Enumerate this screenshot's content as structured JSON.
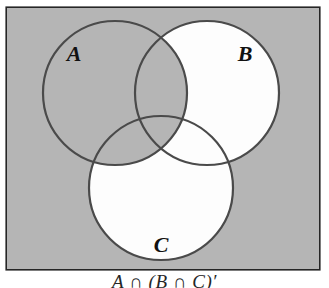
{
  "figure": {
    "kind": "venn-diagram",
    "set_count": 3,
    "panel": {
      "background_color": "#b3b3b3",
      "border_color": "#262626",
      "x": 6,
      "y": 7,
      "width": 314,
      "height": 263
    },
    "shading": {
      "shaded_fill": "#ffffff",
      "unshaded_fill": "#b3b3b3",
      "shaded_description": "regions of B and C that lie outside A",
      "region_states": [
        {
          "region": "A only",
          "fill": "#b3b3b3",
          "shaded": false
        },
        {
          "region": "B only",
          "fill": "#ffffff",
          "shaded": true
        },
        {
          "region": "C only",
          "fill": "#ffffff",
          "shaded": true
        },
        {
          "region": "A and B",
          "fill": "#b3b3b3",
          "shaded": false
        },
        {
          "region": "A and C",
          "fill": "#b3b3b3",
          "shaded": false
        },
        {
          "region": "B and C",
          "fill": "#ffffff",
          "shaded": true
        },
        {
          "region": "A and B and C",
          "fill": "#b3b3b3",
          "shaded": false
        },
        {
          "region": "outside all sets",
          "fill": "#b3b3b3",
          "shaded": false
        }
      ]
    },
    "circles": [
      {
        "id": "A",
        "label": "A",
        "cx": 115,
        "cy": 93,
        "r": 72,
        "fill": "none",
        "stroke": "#4a4a4a"
      },
      {
        "id": "B",
        "label": "B",
        "cx": 207,
        "cy": 93,
        "r": 72,
        "fill": "#ffffff",
        "stroke": "#4a4a4a"
      },
      {
        "id": "C",
        "label": "C",
        "cx": 161,
        "cy": 188,
        "r": 72,
        "fill": "#ffffff",
        "stroke": "#4a4a4a"
      }
    ],
    "labels": [
      {
        "id": "A",
        "text": "A",
        "x": 74,
        "y": 55,
        "color": "#111111"
      },
      {
        "id": "B",
        "text": "B",
        "x": 245,
        "y": 55,
        "color": "#111111"
      },
      {
        "id": "C",
        "text": "C",
        "x": 161,
        "y": 246,
        "color": "#111111"
      }
    ],
    "caption": {
      "text": "A ∩ (B ∩ C)′",
      "clipped": true,
      "note": "only the top edge of the caption is visible at the bottom of the image"
    }
  }
}
